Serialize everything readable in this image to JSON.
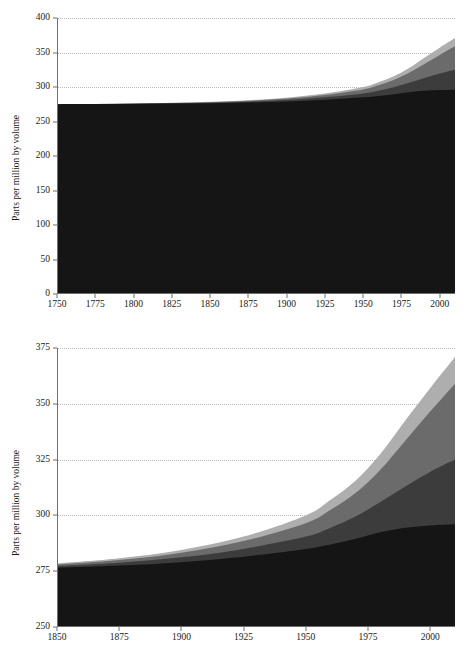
{
  "figure": {
    "background": "#ffffff",
    "axis_color": "#6e6e6e",
    "grid_color": "#b9b9b9"
  },
  "series_colors": {
    "band1": "#151515",
    "band2": "#3c3c3c",
    "band3": "#6b6b6b",
    "band4": "#aeaeae"
  },
  "panels": [
    {
      "id": "panel-top",
      "ylabel": "Parts per million by volume",
      "yticks": [
        "0",
        "50",
        "100",
        "150",
        "200",
        "250",
        "300",
        "350",
        "400"
      ],
      "xticks": [
        "1750",
        "1775",
        "1800",
        "1825",
        "1850",
        "1875",
        "1900",
        "1925",
        "1950",
        "1975",
        "2000"
      ]
    },
    {
      "id": "panel-bottom",
      "ylabel": "Parts per million by volume",
      "yticks": [
        "250",
        "275",
        "300",
        "325",
        "350",
        "375"
      ],
      "xticks": [
        "1850",
        "1875",
        "1900",
        "1925",
        "1950",
        "1975",
        "2000"
      ]
    }
  ],
  "chart_data": [
    {
      "id": "panel-top",
      "type": "area",
      "stacked": true,
      "title": "",
      "xlabel": "",
      "ylabel": "Parts per million by volume",
      "xlim": [
        1750,
        2010
      ],
      "ylim": [
        0,
        400
      ],
      "xticks": [
        1750,
        1775,
        1800,
        1825,
        1850,
        1875,
        1900,
        1925,
        1950,
        1975,
        2000
      ],
      "yticks": [
        0,
        50,
        100,
        150,
        200,
        250,
        300,
        350,
        400
      ],
      "grid": true,
      "legend": "none",
      "x": [
        1750,
        1775,
        1800,
        1825,
        1850,
        1875,
        1900,
        1925,
        1950,
        1960,
        1970,
        1980,
        1990,
        2000,
        2010
      ],
      "series": [
        {
          "name": "band1",
          "color": "#151515",
          "values": [
            275.0,
            275.2,
            275.5,
            276.0,
            276.5,
            277.5,
            279.0,
            281.5,
            285.0,
            287.0,
            289.5,
            292.5,
            294.5,
            295.5,
            296.0
          ]
        },
        {
          "name": "band2",
          "color": "#3c3c3c",
          "values": [
            275.0,
            275.3,
            275.8,
            276.5,
            277.3,
            278.8,
            281.2,
            285.0,
            290.5,
            294.5,
            299.5,
            306.0,
            313.0,
            319.5,
            325.0
          ]
        },
        {
          "name": "band3",
          "color": "#6b6b6b",
          "values": [
            275.0,
            275.4,
            276.0,
            276.9,
            278.0,
            280.0,
            283.3,
            288.5,
            296.5,
            302.5,
            310.0,
            320.5,
            333.5,
            346.5,
            359.0
          ]
        },
        {
          "name": "band4",
          "color": "#aeaeae",
          "values": [
            275.0,
            275.5,
            276.2,
            277.2,
            278.5,
            280.8,
            284.5,
            290.5,
            300.0,
            307.0,
            315.5,
            327.5,
            342.5,
            357.0,
            371.0
          ]
        }
      ]
    },
    {
      "id": "panel-bottom",
      "type": "area",
      "stacked": true,
      "title": "",
      "xlabel": "",
      "ylabel": "Parts per million by volume",
      "xlim": [
        1850,
        2010
      ],
      "ylim": [
        250,
        375
      ],
      "xticks": [
        1850,
        1875,
        1900,
        1925,
        1950,
        1975,
        2000
      ],
      "yticks": [
        250,
        275,
        300,
        325,
        350,
        375
      ],
      "grid": true,
      "legend": "none",
      "x": [
        1850,
        1875,
        1900,
        1925,
        1950,
        1960,
        1970,
        1980,
        1990,
        2000,
        2010
      ],
      "series": [
        {
          "name": "band1",
          "color": "#151515",
          "values": [
            276.5,
            277.5,
            279.0,
            281.5,
            285.0,
            287.0,
            289.5,
            292.5,
            294.5,
            295.5,
            296.0
          ]
        },
        {
          "name": "band2",
          "color": "#3c3c3c",
          "values": [
            277.3,
            278.8,
            281.2,
            285.0,
            290.5,
            294.5,
            299.5,
            306.0,
            313.0,
            319.5,
            325.0
          ]
        },
        {
          "name": "band3",
          "color": "#6b6b6b",
          "values": [
            278.0,
            280.0,
            283.3,
            288.5,
            296.5,
            302.5,
            310.0,
            320.5,
            333.5,
            346.5,
            359.0
          ]
        },
        {
          "name": "band4",
          "color": "#aeaeae",
          "values": [
            278.5,
            280.8,
            284.5,
            290.5,
            300.0,
            307.0,
            315.5,
            327.5,
            342.5,
            357.0,
            371.0
          ]
        }
      ]
    }
  ]
}
